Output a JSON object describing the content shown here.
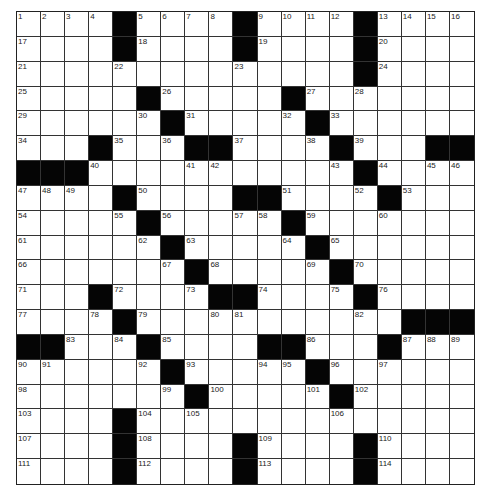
{
  "puzzle": {
    "rows": 19,
    "cols": 19,
    "colors": {
      "black_square": "#050505",
      "white_square": "#ffffff",
      "grid_line": "#333333"
    },
    "legend": {
      "#": "black square",
      "number": "clue number",
      "": "empty white square"
    },
    "grid": [
      [
        "1",
        "2",
        "3",
        "4",
        "#",
        "5",
        "6",
        "7",
        "8",
        "#",
        "9",
        "10",
        "11",
        "12",
        "#",
        "13",
        "14",
        "15",
        "16"
      ],
      [
        "17",
        "",
        "",
        "",
        "#",
        "18",
        "",
        "",
        "",
        "#",
        "19",
        "",
        "",
        "",
        "#",
        "20",
        "",
        "",
        ""
      ],
      [
        "21",
        "",
        "",
        "",
        "22",
        "",
        "",
        "",
        "",
        "23",
        "",
        "",
        "",
        "",
        "#",
        "24",
        "",
        "",
        ""
      ],
      [
        "25",
        "",
        "",
        "",
        "",
        "#",
        "26",
        "",
        "",
        "",
        "",
        "#",
        "27",
        "",
        "28",
        "",
        "",
        "",
        ""
      ],
      [
        "29",
        "",
        "",
        "",
        "",
        "30",
        "#",
        "31",
        "",
        "",
        "",
        "32",
        "#",
        "33",
        "",
        "",
        "",
        "",
        ""
      ],
      [
        "34",
        "",
        "",
        "#",
        "35",
        "",
        "36",
        "#",
        "#",
        "37",
        "",
        "",
        "38",
        "#",
        "39",
        "",
        "",
        "#",
        "#"
      ],
      [
        "#",
        "#",
        "#",
        "40",
        "",
        "",
        "",
        "41",
        "42",
        "",
        "",
        "",
        "",
        "43",
        "#",
        "44",
        "",
        "45",
        "46"
      ],
      [
        "47",
        "48",
        "49",
        "",
        "#",
        "50",
        "",
        "",
        "",
        "#",
        "#",
        "51",
        "",
        "",
        "52",
        "#",
        "53",
        "",
        ""
      ],
      [
        "54",
        "",
        "",
        "",
        "55",
        "#",
        "56",
        "",
        "",
        "57",
        "58",
        "#",
        "59",
        "",
        "",
        "60",
        "",
        "",
        ""
      ],
      [
        "61",
        "",
        "",
        "",
        "",
        "62",
        "#",
        "63",
        "",
        "",
        "",
        "64",
        "#",
        "65",
        "",
        "",
        "",
        "",
        ""
      ],
      [
        "66",
        "",
        "",
        "",
        "",
        "",
        "67",
        "#",
        "68",
        "",
        "",
        "",
        "69",
        "#",
        "70",
        "",
        "",
        "",
        ""
      ],
      [
        "71",
        "",
        "",
        "#",
        "72",
        "",
        "",
        "73",
        "#",
        "#",
        "74",
        "",
        "",
        "75",
        "#",
        "76",
        "",
        "",
        ""
      ],
      [
        "77",
        "",
        "",
        "78",
        "#",
        "79",
        "",
        "",
        "80",
        "81",
        "",
        "",
        "",
        "",
        "82",
        "",
        "#",
        "#",
        "#"
      ],
      [
        "#",
        "#",
        "83",
        "",
        "84",
        "#",
        "85",
        "",
        "",
        "",
        "#",
        "#",
        "86",
        "",
        "",
        "#",
        "87",
        "88",
        "89"
      ],
      [
        "90",
        "91",
        "",
        "",
        "",
        "92",
        "#",
        "93",
        "",
        "",
        "94",
        "95",
        "#",
        "96",
        "",
        "97",
        "",
        "",
        ""
      ],
      [
        "98",
        "",
        "",
        "",
        "",
        "",
        "99",
        "#",
        "100",
        "",
        "",
        "",
        "101",
        "#",
        "102",
        "",
        "",
        "",
        ""
      ],
      [
        "103",
        "",
        "",
        "",
        "#",
        "104",
        "",
        "105",
        "",
        "",
        "",
        "",
        "",
        "106",
        "",
        "",
        "",
        "",
        ""
      ],
      [
        "107",
        "",
        "",
        "",
        "#",
        "108",
        "",
        "",
        "",
        "#",
        "109",
        "",
        "",
        "",
        "#",
        "110",
        "",
        "",
        ""
      ],
      [
        "111",
        "",
        "",
        "",
        "#",
        "112",
        "",
        "",
        "",
        "#",
        "113",
        "",
        "",
        "",
        "#",
        "114",
        "",
        "",
        ""
      ]
    ]
  }
}
